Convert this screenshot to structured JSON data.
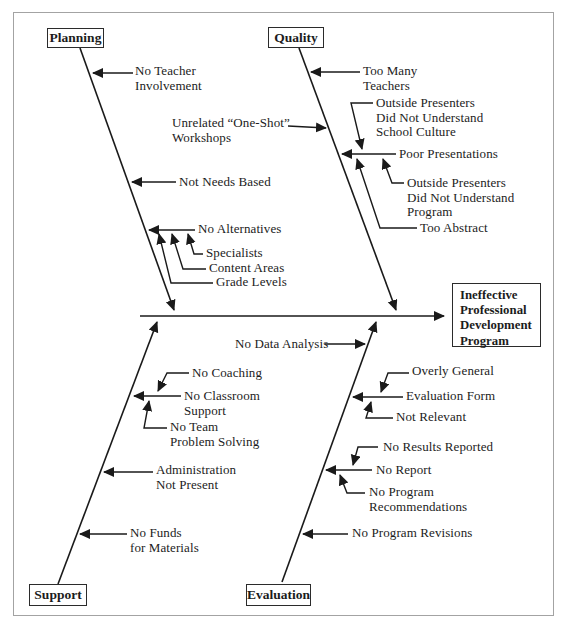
{
  "colors": {
    "line": "#1a1a1a",
    "text": "#1c1c1c",
    "frame_border": "#a3a3a3",
    "box_border": "#2b2b2b"
  },
  "effect": {
    "label": "Ineffective\nProfessional\nDevelopment\nProgram"
  },
  "categories": {
    "planning": {
      "label": "Planning"
    },
    "quality": {
      "label": "Quality"
    },
    "support": {
      "label": "Support"
    },
    "evaluation": {
      "label": "Evaluation"
    }
  },
  "causes": {
    "planning": {
      "no_teacher_involvement": "No Teacher\nInvolvement",
      "not_needs_based": "Not Needs Based",
      "no_alternatives": "No Alternatives",
      "specialists": "Specialists",
      "content_areas": "Content Areas",
      "grade_levels": "Grade Levels"
    },
    "quality": {
      "too_many_teachers": "Too Many\nTeachers",
      "unrelated_one_shot_workshops": "Unrelated “One-Shot”\nWorkshops",
      "outside_presenters_school_culture": "Outside Presenters\nDid Not Understand\nSchool Culture",
      "poor_presentations": "Poor Presentations",
      "outside_presenters_program": "Outside Presenters\nDid Not Understand\nProgram",
      "too_abstract": "Too Abstract"
    },
    "spine": {
      "no_data_analysis": "No Data Analysis"
    },
    "support": {
      "no_coaching": "No Coaching",
      "no_classroom_support": "No Classroom\nSupport",
      "no_team_problem_solving": "No Team\nProblem Solving",
      "administration_not_present": "Administration\nNot Present",
      "no_funds_for_materials": "No Funds\nfor Materials"
    },
    "evaluation": {
      "overly_general": "Overly General",
      "evaluation_form": "Evaluation Form",
      "not_relevant": "Not Relevant",
      "no_results_reported": "No Results Reported",
      "no_report": "No Report",
      "no_program_recommendations": "No Program\nRecommendations",
      "no_program_revisions": "No Program Revisions"
    }
  }
}
